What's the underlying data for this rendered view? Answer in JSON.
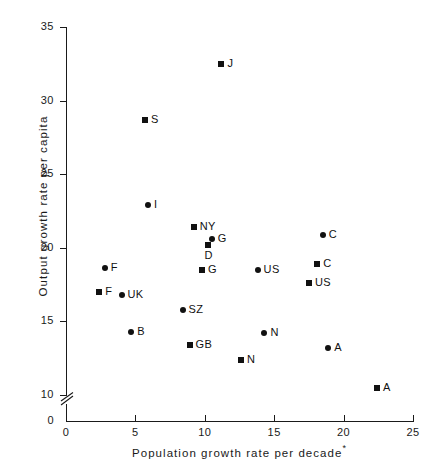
{
  "chart_data": {
    "type": "scatter",
    "title": "",
    "xlabel": "Population growth rate per decade",
    "xlabel_footnote": "*",
    "ylabel": "Output growth rate per capita",
    "xlim": [
      0,
      25
    ],
    "ylim": [
      10,
      35
    ],
    "y_axis_break": true,
    "y_axis_break_below": 10,
    "y_axis_origin_label": "0",
    "xticks": [
      0,
      5,
      10,
      15,
      20,
      25
    ],
    "yticks": [
      10,
      15,
      20,
      25,
      30,
      35
    ],
    "xtick_labels": [
      "0",
      "5",
      "10",
      "15",
      "20",
      "25"
    ],
    "ytick_labels": [
      "10",
      "15",
      "20",
      "25",
      "30",
      "35"
    ],
    "grid": false,
    "legend": null,
    "marker_types": [
      "square",
      "circle"
    ],
    "marker_color": "#111111",
    "points": [
      {
        "label": "J",
        "x": 11.2,
        "y": 32.5,
        "marker": "square",
        "label_pos": "right"
      },
      {
        "label": "S",
        "x": 5.7,
        "y": 28.7,
        "marker": "square",
        "label_pos": "right"
      },
      {
        "label": "I",
        "x": 5.9,
        "y": 22.9,
        "marker": "circle",
        "label_pos": "right"
      },
      {
        "label": "NY",
        "x": 9.2,
        "y": 21.4,
        "marker": "square",
        "label_pos": "right"
      },
      {
        "label": "G",
        "x": 10.5,
        "y": 20.6,
        "marker": "circle",
        "label_pos": "right"
      },
      {
        "label": "D",
        "x": 10.2,
        "y": 20.2,
        "marker": "square",
        "label_pos": "below"
      },
      {
        "label": "C",
        "x": 18.5,
        "y": 20.9,
        "marker": "circle",
        "label_pos": "right"
      },
      {
        "label": "F",
        "x": 2.8,
        "y": 18.6,
        "marker": "circle",
        "label_pos": "right"
      },
      {
        "label": "C",
        "x": 18.1,
        "y": 18.9,
        "marker": "square",
        "label_pos": "right"
      },
      {
        "label": "G",
        "x": 9.8,
        "y": 18.5,
        "marker": "square",
        "label_pos": "right"
      },
      {
        "label": "US",
        "x": 13.8,
        "y": 18.5,
        "marker": "circle",
        "label_pos": "right"
      },
      {
        "label": "US",
        "x": 17.5,
        "y": 17.6,
        "marker": "square",
        "label_pos": "right"
      },
      {
        "label": "F",
        "x": 2.4,
        "y": 17.0,
        "marker": "square",
        "label_pos": "right"
      },
      {
        "label": "UK",
        "x": 4.0,
        "y": 16.8,
        "marker": "circle",
        "label_pos": "right"
      },
      {
        "label": "SZ",
        "x": 8.4,
        "y": 15.8,
        "marker": "circle",
        "label_pos": "right"
      },
      {
        "label": "B",
        "x": 4.7,
        "y": 14.3,
        "marker": "circle",
        "label_pos": "right"
      },
      {
        "label": "N",
        "x": 14.3,
        "y": 14.2,
        "marker": "circle",
        "label_pos": "right"
      },
      {
        "label": "GB",
        "x": 8.9,
        "y": 13.4,
        "marker": "square",
        "label_pos": "right"
      },
      {
        "label": "A",
        "x": 18.9,
        "y": 13.2,
        "marker": "circle",
        "label_pos": "right"
      },
      {
        "label": "N",
        "x": 12.6,
        "y": 12.4,
        "marker": "square",
        "label_pos": "right"
      },
      {
        "label": "A",
        "x": 22.4,
        "y": 10.5,
        "marker": "square",
        "label_pos": "right"
      }
    ]
  }
}
